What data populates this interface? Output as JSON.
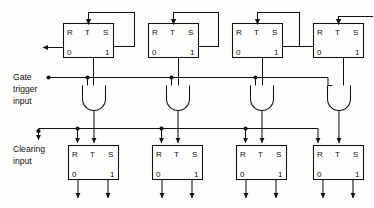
{
  "diagram": {
    "colors": {
      "ink": "#111111",
      "paper": "#fdfdfb"
    },
    "labels": {
      "gate_line1": "Gate",
      "gate_line2": "trigger",
      "gate_line3": "input",
      "clear_line1": "Clearing",
      "clear_line2": "input"
    },
    "pins": {
      "r": "R",
      "t": "T",
      "s": "S",
      "zero": "0",
      "one": "1"
    },
    "top_flipflops": [
      {
        "id": "ff-top-1",
        "r": "R",
        "t": "T",
        "s": "S",
        "zero": "0",
        "one": "1"
      },
      {
        "id": "ff-top-2",
        "r": "R",
        "t": "T",
        "s": "S",
        "zero": "0",
        "one": "1"
      },
      {
        "id": "ff-top-3",
        "r": "R",
        "t": "T",
        "s": "S",
        "zero": "0",
        "one": "1"
      },
      {
        "id": "ff-top-4",
        "r": "R",
        "t": "T",
        "s": "S",
        "zero": "0",
        "one": "1"
      }
    ],
    "bottom_flipflops": [
      {
        "id": "ff-bot-1",
        "r": "R",
        "t": "T",
        "s": "S",
        "zero": "0",
        "one": "1"
      },
      {
        "id": "ff-bot-2",
        "r": "R",
        "t": "T",
        "s": "S",
        "zero": "0",
        "one": "1"
      },
      {
        "id": "ff-bot-3",
        "r": "R",
        "t": "T",
        "s": "S",
        "zero": "0",
        "one": "1"
      },
      {
        "id": "ff-bot-4",
        "r": "R",
        "t": "T",
        "s": "S",
        "zero": "0",
        "one": "1"
      }
    ],
    "and_gates": [
      {
        "id": "and-gate-1"
      },
      {
        "id": "and-gate-2"
      },
      {
        "id": "and-gate-3"
      },
      {
        "id": "and-gate-4"
      }
    ]
  }
}
